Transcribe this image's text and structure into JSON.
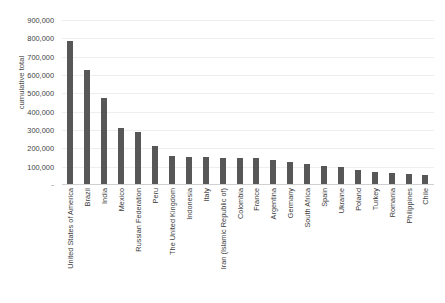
{
  "chart_data": {
    "type": "bar",
    "title": "",
    "xlabel": "",
    "ylabel": "cumulative total",
    "ylim": [
      0,
      900000
    ],
    "ytick_labels": [
      "900,000",
      "800,000",
      "700,000",
      "600,000",
      "500,000",
      "400,000",
      "300,000",
      "200,000",
      "100,000",
      "-"
    ],
    "ytick_values": [
      900000,
      800000,
      700000,
      600000,
      500000,
      400000,
      300000,
      200000,
      100000,
      0
    ],
    "grid": true,
    "legend": "none",
    "bar_color": "#575757",
    "categories": [
      "United States of America",
      "Brazil",
      "India",
      "Mexico",
      "Russian Federation",
      "Peru",
      "The United Kingdom",
      "Indonesia",
      "Italy",
      "Iran (Islamic Republic of)",
      "Colombia",
      "France",
      "Argentina",
      "Germany",
      "South Africa",
      "Spain",
      "Ukraine",
      "Poland",
      "Turkey",
      "Romania",
      "Philippines",
      "Chile"
    ],
    "values": [
      780000,
      620000,
      470000,
      305000,
      285000,
      205000,
      155000,
      150000,
      145000,
      140000,
      140000,
      140000,
      130000,
      120000,
      110000,
      100000,
      95000,
      75000,
      65000,
      58000,
      52000,
      50000
    ]
  }
}
